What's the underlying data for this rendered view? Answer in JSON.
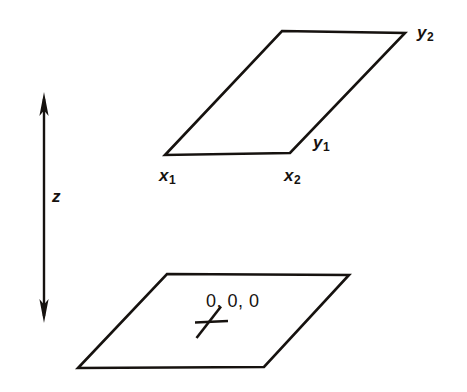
{
  "figure": {
    "background_color": "#ffffff",
    "stroke_color": "#16120f",
    "width": 467,
    "height": 392
  },
  "labels": {
    "x1": "x",
    "x1_sub": "1",
    "x2": "x",
    "x2_sub": "2",
    "y1": "y",
    "y1_sub": "1",
    "y2": "y",
    "y2_sub": "2",
    "z": "z",
    "origin": "0, 0, 0"
  },
  "shapes": {
    "top_plane": {
      "name": "upper-plane",
      "points": "282,31 405,33 290,153 165,155"
    },
    "bottom_plane": {
      "name": "lower-plane",
      "points": "167,274 349,275 264,367 78,368"
    },
    "z_axis": {
      "name": "z-axis-double-arrow",
      "x": 44,
      "top_y": 95,
      "bottom_y": 320
    },
    "origin_mark": {
      "name": "origin-cross-mark",
      "horizontal": "195,322 228,321",
      "diagonal": "197,338 221,307"
    }
  }
}
